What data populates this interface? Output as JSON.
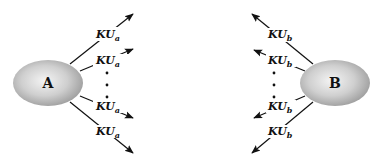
{
  "diagram": {
    "nodes": [
      {
        "id": "A",
        "label": "A",
        "cx": 48,
        "cy": 83
      },
      {
        "id": "B",
        "label": "B",
        "cx": 335,
        "cy": 83
      }
    ],
    "node_a": {
      "label": "A"
    },
    "node_b": {
      "label": "B"
    },
    "key_base": "KU",
    "a_edges": [
      {
        "label_base": "KU",
        "label_sub": "a"
      },
      {
        "label_base": "KU",
        "label_sub": "a"
      },
      {
        "label_base": "KU",
        "label_sub": "a"
      },
      {
        "label_base": "KU",
        "label_sub": "a"
      }
    ],
    "b_edges": [
      {
        "label_base": "KU",
        "label_sub": "b"
      },
      {
        "label_base": "KU",
        "label_sub": "b"
      },
      {
        "label_base": "KU",
        "label_sub": "b"
      },
      {
        "label_base": "KU",
        "label_sub": "b"
      }
    ],
    "ellipsis": "⋮",
    "colors": {
      "node_light": "#f2f2f2",
      "node_dark": "#9a9a9a",
      "line": "#111111"
    }
  }
}
